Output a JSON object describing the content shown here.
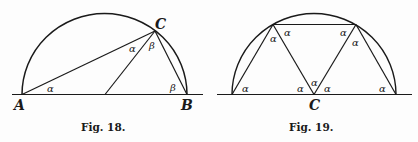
{
  "figures": [
    {
      "caption": "Fig. 18.",
      "points": {
        "A": "A",
        "B": "B",
        "C": "C"
      },
      "angle_labels": {
        "at_A": "α",
        "at_C_left": "α",
        "at_C_right": "β",
        "at_B": "β"
      }
    },
    {
      "caption": "Fig. 19.",
      "points": {
        "C": "C"
      },
      "angle_labels": {
        "left_base": "α",
        "left_top_inner": "α",
        "left_top_right": "α",
        "center_left": "α",
        "center_mid": "α",
        "center_right": "α",
        "right_top_left": "α",
        "right_top_inner": "α",
        "right_base": "α"
      }
    }
  ],
  "colors": {
    "ink": "#1a1a1a",
    "paper": "#fdfdfd"
  }
}
